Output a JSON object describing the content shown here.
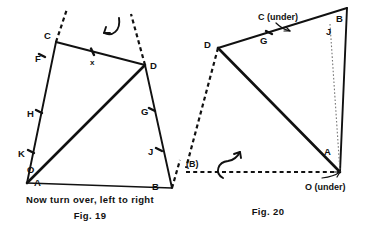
{
  "figures": [
    {
      "id": "fig-19",
      "caption_instruction": "Now turn over, left to right",
      "caption": "Fig. 19",
      "labels": {
        "C": "C",
        "F": "F",
        "x": "x",
        "D": "D",
        "H": "H",
        "G": "G",
        "K": "K",
        "O": "O",
        "J": "J",
        "A": "A",
        "B": "B"
      },
      "rotation_arrow": "rotate-left-arrow"
    },
    {
      "id": "fig-20",
      "caption": "Fig. 20",
      "labels": {
        "C_under": "C (under)",
        "D": "D",
        "G": "G",
        "J": "J",
        "B": "B",
        "B_paren": "(B)",
        "A": "A",
        "O_under": "O (under)"
      },
      "rotation_arrow": "rotate-up-arrow"
    }
  ],
  "colors": {
    "ink": "#111111",
    "faint_ink": "#777777",
    "paper": "#ffffff"
  }
}
